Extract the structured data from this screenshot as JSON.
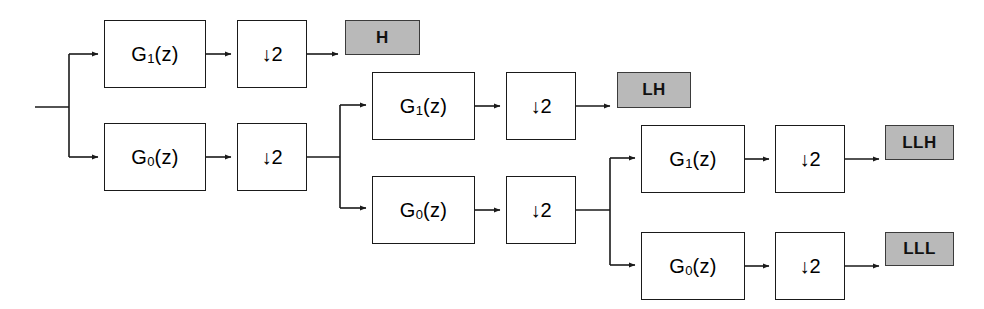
{
  "diagram": {
    "type": "block-diagram",
    "canvas": {
      "width": 984,
      "height": 309
    },
    "colors": {
      "line": "#1a1a1a",
      "box_fill": "#ffffff",
      "box_border": "#1a1a1a",
      "label_fill": "#b9b9b9",
      "label_border": "#3b3b3b",
      "text": "#000000",
      "background": "#ffffff"
    },
    "input": {
      "label": ""
    },
    "blocks": [
      {
        "id": "g1-stage1",
        "kind": "filter",
        "text_main": "G",
        "text_sub": "1",
        "text_tail": "(z)",
        "label": "G1(z)",
        "x": 104,
        "y": 20,
        "w": 102,
        "h": 68
      },
      {
        "id": "down-stage1-hi",
        "kind": "downsampler",
        "label": "↓2",
        "x": 237,
        "y": 20,
        "w": 70,
        "h": 68
      },
      {
        "id": "g0-stage1",
        "kind": "filter",
        "text_main": "G",
        "text_sub": "0",
        "text_tail": "(z)",
        "label": "G0(z)",
        "x": 104,
        "y": 123,
        "w": 102,
        "h": 68
      },
      {
        "id": "down-stage1-lo",
        "kind": "downsampler",
        "label": "↓2",
        "x": 237,
        "y": 123,
        "w": 70,
        "h": 68
      },
      {
        "id": "g1-stage2",
        "kind": "filter",
        "text_main": "G",
        "text_sub": "1",
        "text_tail": "(z)",
        "label": "G1(z)",
        "x": 372,
        "y": 72,
        "w": 103,
        "h": 68
      },
      {
        "id": "down-stage2-hi",
        "kind": "downsampler",
        "label": "↓2",
        "x": 506,
        "y": 72,
        "w": 70,
        "h": 68
      },
      {
        "id": "g0-stage2",
        "kind": "filter",
        "text_main": "G",
        "text_sub": "0",
        "text_tail": "(z)",
        "label": "G0(z)",
        "x": 372,
        "y": 176,
        "w": 103,
        "h": 68
      },
      {
        "id": "down-stage2-lo",
        "kind": "downsampler",
        "label": "↓2",
        "x": 506,
        "y": 176,
        "w": 70,
        "h": 68
      },
      {
        "id": "g1-stage3",
        "kind": "filter",
        "text_main": "G",
        "text_sub": "1",
        "text_tail": "(z)",
        "label": "G1(z)",
        "x": 641,
        "y": 125,
        "w": 104,
        "h": 68
      },
      {
        "id": "down-stage3-hi",
        "kind": "downsampler",
        "label": "↓2",
        "x": 775,
        "y": 125,
        "w": 70,
        "h": 68
      },
      {
        "id": "g0-stage3",
        "kind": "filter",
        "text_main": "G",
        "text_sub": "0",
        "text_tail": "(z)",
        "label": "G0(z)",
        "x": 641,
        "y": 232,
        "w": 104,
        "h": 68
      },
      {
        "id": "down-stage3-lo",
        "kind": "downsampler",
        "label": "↓2",
        "x": 775,
        "y": 232,
        "w": 70,
        "h": 68
      }
    ],
    "outputs": [
      {
        "id": "out-h",
        "label": "H",
        "x": 345,
        "y": 20,
        "w": 75,
        "h": 35
      },
      {
        "id": "out-lh",
        "label": "LH",
        "x": 617,
        "y": 72,
        "w": 74,
        "h": 36
      },
      {
        "id": "out-llh",
        "label": "LLH",
        "x": 885,
        "y": 125,
        "w": 69,
        "h": 35
      },
      {
        "id": "out-lll",
        "label": "LLL",
        "x": 885,
        "y": 232,
        "w": 69,
        "h": 34
      }
    ],
    "wires": [
      {
        "id": "w-input",
        "d": "M 35 107 L 69 107"
      },
      {
        "id": "w-split1-trunk",
        "d": "M 69 54 L 69 157"
      },
      {
        "id": "w-split1-hi",
        "d": "M 69 54 L 98 54",
        "arrow": true
      },
      {
        "id": "w-split1-lo",
        "d": "M 69 157 L 98 157",
        "arrow": true
      },
      {
        "id": "w-g1s1-down",
        "d": "M 206 54 L 231 54",
        "arrow": true
      },
      {
        "id": "w-down-h",
        "d": "M 307 54 L 338 54",
        "arrow": true
      },
      {
        "id": "w-g0s1-down",
        "d": "M 206 157 L 231 157",
        "arrow": true
      },
      {
        "id": "w-down1-split2",
        "d": "M 307 157 L 340 157"
      },
      {
        "id": "w-split2-trunk",
        "d": "M 340 105 L 340 208"
      },
      {
        "id": "w-split2-hi",
        "d": "M 340 105 L 366 105",
        "arrow": true
      },
      {
        "id": "w-split2-lo",
        "d": "M 340 208 L 366 208",
        "arrow": true
      },
      {
        "id": "w-g1s2-down",
        "d": "M 475 106 L 500 106",
        "arrow": true
      },
      {
        "id": "w-down-lh",
        "d": "M 576 106 L 610 106",
        "arrow": true
      },
      {
        "id": "w-g0s2-down",
        "d": "M 475 210 L 500 210",
        "arrow": true
      },
      {
        "id": "w-down2-split3",
        "d": "M 576 210 L 610 210"
      },
      {
        "id": "w-split3-trunk",
        "d": "M 610 158 L 610 265"
      },
      {
        "id": "w-split3-hi",
        "d": "M 610 158 L 635 158",
        "arrow": true
      },
      {
        "id": "w-split3-lo",
        "d": "M 610 265 L 635 265",
        "arrow": true
      },
      {
        "id": "w-g1s3-down",
        "d": "M 745 159 L 769 159",
        "arrow": true
      },
      {
        "id": "w-down-llh",
        "d": "M 845 159 L 879 159",
        "arrow": true
      },
      {
        "id": "w-g0s3-down",
        "d": "M 745 266 L 769 266",
        "arrow": true
      },
      {
        "id": "w-down-lll",
        "d": "M 845 266 L 879 266",
        "arrow": true
      }
    ]
  }
}
